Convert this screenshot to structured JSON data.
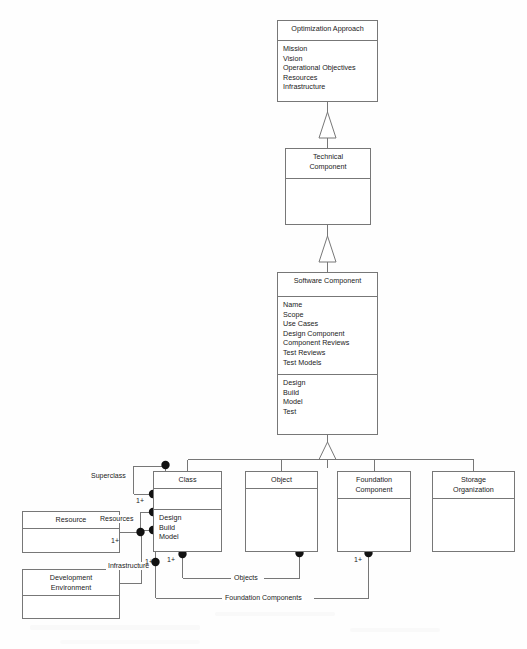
{
  "diagram": {
    "type": "uml-class-diagram",
    "line_color": "#777777",
    "text_color": "#1a1a1a",
    "background": "#fefefe"
  },
  "classes": {
    "optimization_approach": {
      "name": "Optimization Approach",
      "attributes": "Mission\nVision\nOperational Objectives\nResources\nInfrastructure",
      "x": 277,
      "y": 20,
      "w": 101,
      "h": 82
    },
    "technical_component": {
      "name": "Technical\nComponent",
      "attributes": "",
      "x": 285,
      "y": 148,
      "w": 86,
      "h": 77
    },
    "software_component": {
      "name": "Software Component",
      "attributes": "Name\nScope\nUse Cases\nDesign Component\nComponent Reviews\nTest Reviews\nTest Models",
      "operations": "Design\nBuild\nModel\nTest",
      "x": 277,
      "y": 272,
      "w": 101,
      "h": 163
    },
    "class_box": {
      "name": "Class",
      "attributes": "",
      "operations": "Design\nBuild\nModel",
      "x": 153,
      "y": 471,
      "w": 69,
      "h": 81
    },
    "object_box": {
      "name": "Object",
      "attributes": "",
      "x": 245,
      "y": 471,
      "w": 73,
      "h": 81
    },
    "foundation_component": {
      "name": "Foundation\nComponent",
      "attributes": "",
      "x": 337,
      "y": 471,
      "w": 74,
      "h": 81
    },
    "storage_organization": {
      "name": "Storage\nOrganization",
      "attributes": "",
      "x": 432,
      "y": 471,
      "w": 83,
      "h": 81
    },
    "resource": {
      "name": "Resource",
      "attributes": "",
      "x": 22,
      "y": 511,
      "w": 98,
      "h": 42
    },
    "development_environment": {
      "name": "Development\nEnvironment",
      "attributes": "",
      "x": 22,
      "y": 569,
      "w": 98,
      "h": 50
    }
  },
  "edge_labels": {
    "superclass": "Superclass",
    "resources": "Resources",
    "infrastructure": "Infrastructure",
    "objects": "Objects",
    "foundation_components": "Foundation Components"
  },
  "multiplicities": {
    "superclass_mult": "1+",
    "resources_mult": "1+",
    "infrastructure_mult": "1+",
    "objects_mult": "1+",
    "foundation_mult": "1+"
  },
  "relationships": [
    {
      "type": "generalization",
      "from": "technical_component",
      "to": "optimization_approach"
    },
    {
      "type": "generalization",
      "from": "software_component",
      "to": "technical_component"
    },
    {
      "type": "generalization",
      "from": "class_box",
      "to": "software_component"
    },
    {
      "type": "generalization",
      "from": "object_box",
      "to": "software_component"
    },
    {
      "type": "generalization",
      "from": "foundation_component",
      "to": "software_component"
    },
    {
      "type": "generalization",
      "from": "storage_organization",
      "to": "software_component"
    },
    {
      "type": "association",
      "from": "class_box",
      "to": "class_box",
      "label": "Superclass",
      "multiplicity": "1+"
    },
    {
      "type": "association",
      "from": "resource",
      "to": "class_box",
      "label": "Resources",
      "multiplicity": "1+"
    },
    {
      "type": "association",
      "from": "development_environment",
      "to": "class_box",
      "label": "Infrastructure",
      "multiplicity": "1+"
    },
    {
      "type": "association",
      "from": "class_box",
      "to": "object_box",
      "label": "Objects",
      "multiplicity": "1+"
    },
    {
      "type": "association",
      "from": "class_box",
      "to": "foundation_component",
      "label": "Foundation Components",
      "multiplicity": "1+"
    }
  ]
}
